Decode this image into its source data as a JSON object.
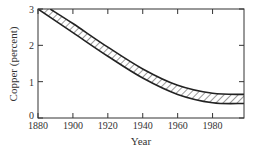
{
  "chart_data": {
    "type": "area",
    "title": "",
    "xlabel": "Year",
    "ylabel": "Copper (percent)",
    "xlim": [
      1880,
      1998
    ],
    "ylim": [
      0,
      3
    ],
    "x_ticks": [
      1880,
      1900,
      1920,
      1940,
      1960,
      1980
    ],
    "y_ticks": [
      0,
      1,
      2,
      3
    ],
    "grid": false,
    "legend": null,
    "fill": "hatched band between upper and lower bounds",
    "series": [
      {
        "name": "upper bound",
        "x": [
          1887,
          1900,
          1920,
          1940,
          1960,
          1980,
          1998
        ],
        "y": [
          3.0,
          2.6,
          1.95,
          1.35,
          0.9,
          0.68,
          0.65
        ]
      },
      {
        "name": "lower bound",
        "x": [
          1880,
          1900,
          1920,
          1940,
          1960,
          1980,
          1998
        ],
        "y": [
          3.0,
          2.35,
          1.7,
          1.1,
          0.65,
          0.42,
          0.4
        ]
      }
    ]
  },
  "labels": {
    "xlabel": "Year",
    "ylabel": "Copper (percent)",
    "x_ticks": [
      "1880",
      "1900",
      "1920",
      "1940",
      "1960",
      "1980"
    ],
    "y_ticks": [
      "0",
      "1",
      "2",
      "3"
    ]
  }
}
